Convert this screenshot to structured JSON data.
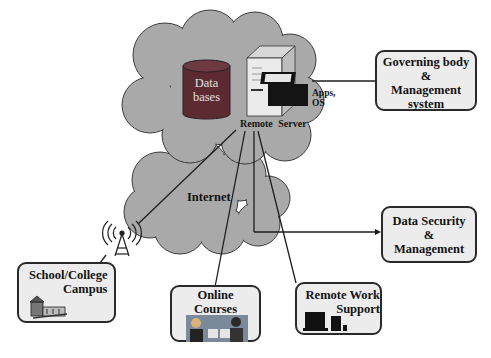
{
  "diagram": {
    "cloud_top": {
      "label_database": [
        "Data",
        "bases"
      ],
      "server_label": "Remote Server",
      "apps_label": [
        "Apps,",
        "OS"
      ]
    },
    "cloud_bottom": {
      "label": "Internet"
    },
    "nodes": {
      "governing": {
        "lines": [
          "Governing body",
          "&",
          "Management",
          "system"
        ]
      },
      "security": {
        "lines": [
          "Data Security",
          "&",
          "Management"
        ]
      },
      "campus": {
        "lines": [
          "School/College",
          "Campus"
        ]
      },
      "courses": {
        "lines": [
          "Online",
          "Courses"
        ]
      },
      "remote_work": {
        "lines": [
          "Remote Work",
          "Support"
        ]
      }
    },
    "colors": {
      "cloud": "#a9a9a9",
      "cloud_stroke": "#3a3a3a",
      "box_fill": "#ececec",
      "box_border": "#2a2a2a",
      "database": "#5e2a32",
      "line": "#1e1e1e"
    }
  }
}
